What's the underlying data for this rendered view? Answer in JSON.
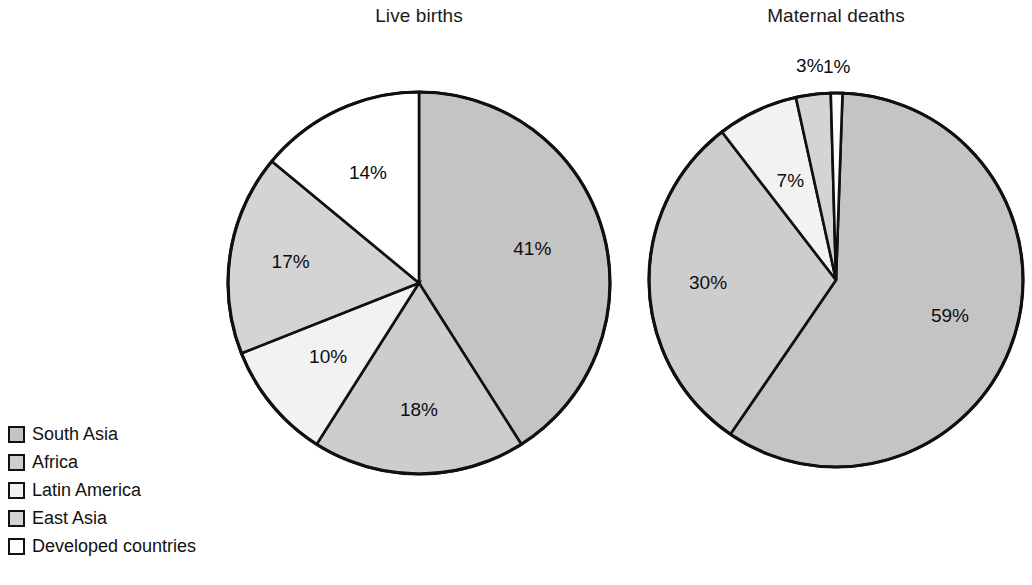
{
  "figure": {
    "background_color": "#ffffff",
    "line_color": "#101010"
  },
  "legend": {
    "items": [
      {
        "label": "South Asia",
        "color": "#c4c4c4",
        "key": "south_asia"
      },
      {
        "label": "Africa",
        "color": "#cdcdcd",
        "key": "africa"
      },
      {
        "label": "Latin America",
        "color": "#f2f2f2",
        "key": "latin_america"
      },
      {
        "label": "East Asia",
        "color": "#d4d4d4",
        "key": "east_asia"
      },
      {
        "label": "Developed countries",
        "color": "#ffffff",
        "key": "developed_countries"
      }
    ]
  },
  "chart_data": [
    {
      "type": "pie",
      "title": "Live births",
      "categories": [
        "South Asia",
        "Africa",
        "Latin America",
        "East Asia",
        "Developed countries"
      ],
      "values": [
        41,
        18,
        10,
        17,
        14
      ],
      "value_labels": [
        "41%",
        "18%",
        "10%",
        "17%",
        "14%"
      ],
      "colors": [
        "#c4c4c4",
        "#cdcdcd",
        "#f2f2f2",
        "#d4d4d4",
        "#ffffff"
      ],
      "units": "percent",
      "start_angle_deg": 0,
      "direction": "clockwise",
      "legend_position": "bottom-left",
      "xlabel": "",
      "ylabel": ""
    },
    {
      "type": "pie",
      "title": "Maternal deaths",
      "categories": [
        "South Asia",
        "Africa",
        "Latin America",
        "East Asia",
        "Developed countries"
      ],
      "values": [
        59,
        30,
        7,
        3,
        1
      ],
      "value_labels": [
        "59%",
        "30%",
        "7%",
        "3%",
        "1%"
      ],
      "colors": [
        "#c4c4c4",
        "#cdcdcd",
        "#f2f2f2",
        "#d4d4d4",
        "#ffffff"
      ],
      "units": "percent",
      "start_angle_deg": 2,
      "direction": "clockwise",
      "legend_position": "bottom-left",
      "xlabel": "",
      "ylabel": ""
    }
  ]
}
